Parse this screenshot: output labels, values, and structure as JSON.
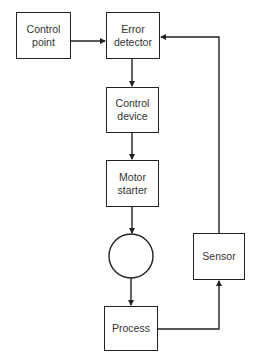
{
  "diagram": {
    "type": "block-diagram",
    "title": "",
    "nodes": [
      {
        "id": "control_point",
        "label": "Control\npoint"
      },
      {
        "id": "error_detector",
        "label": "Error\ndetector"
      },
      {
        "id": "control_device",
        "label": "Control\ndevice"
      },
      {
        "id": "motor_starter",
        "label": "Motor\nstarter"
      },
      {
        "id": "motor",
        "label": "",
        "shape": "circle"
      },
      {
        "id": "process",
        "label": "Process"
      },
      {
        "id": "sensor",
        "label": "Sensor"
      }
    ],
    "edges": [
      {
        "from": "control_point",
        "to": "error_detector"
      },
      {
        "from": "error_detector",
        "to": "control_device"
      },
      {
        "from": "control_device",
        "to": "motor_starter"
      },
      {
        "from": "motor_starter",
        "to": "motor"
      },
      {
        "from": "motor",
        "to": "process"
      },
      {
        "from": "process",
        "to": "sensor"
      },
      {
        "from": "sensor",
        "to": "error_detector"
      }
    ],
    "colors": {
      "line": "#222222",
      "text": "#333333",
      "background": "#ffffff"
    }
  }
}
